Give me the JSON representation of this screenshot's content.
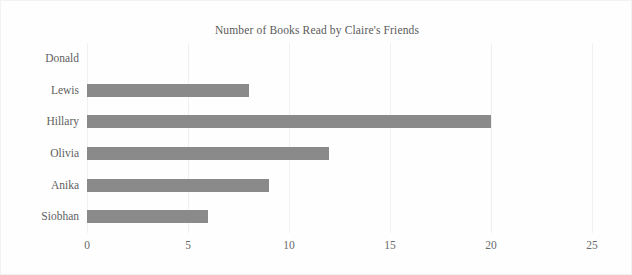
{
  "chart_data": {
    "type": "bar",
    "orientation": "horizontal",
    "title": "Number of Books Read by Claire's Friends",
    "xlabel": "",
    "ylabel": "",
    "categories": [
      "Donald",
      "Lewis",
      "Hillary",
      "Olivia",
      "Anika",
      "Siobhan"
    ],
    "values": [
      0,
      8,
      20,
      12,
      9,
      6
    ],
    "series": [
      {
        "name": "Books Read",
        "values": [
          0,
          8,
          20,
          12,
          9,
          6
        ]
      }
    ],
    "xlim": [
      0,
      25
    ],
    "xticks": [
      0,
      5,
      10,
      15,
      20,
      25
    ],
    "xtick_labels": [
      "0",
      "5",
      "10",
      "15",
      "20",
      "25"
    ],
    "grid": "vertical",
    "legend": "none",
    "bar_color": "#8a8a8a",
    "background_color": "#fefefe",
    "gridline_color": "#f0f0f0",
    "text_color": "#5a5a5a"
  }
}
